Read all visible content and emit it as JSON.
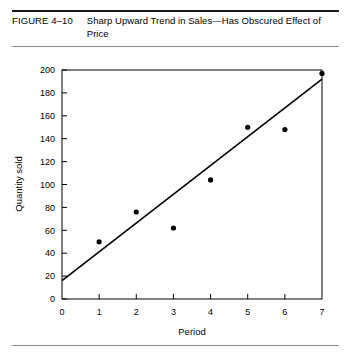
{
  "figure": {
    "label": "FIGURE 4–10",
    "title": "Sharp Upward Trend in Sales—Has Obscured Effect of Price"
  },
  "chart_data": {
    "type": "scatter",
    "title": "Sharp Upward Trend in Sales—Has Obscured Effect of Price",
    "xlabel": "Period",
    "ylabel": "Quantity sold",
    "xlim": [
      0,
      7
    ],
    "ylim": [
      0,
      200
    ],
    "grid": false,
    "legend": null,
    "x_ticks": [
      "0",
      "1",
      "2",
      "3",
      "4",
      "5",
      "6",
      "7"
    ],
    "y_ticks": [
      "0",
      "20",
      "40",
      "60",
      "80",
      "100",
      "120",
      "140",
      "160",
      "180",
      "200"
    ],
    "points": [
      {
        "x": 1,
        "y": 50
      },
      {
        "x": 2,
        "y": 76
      },
      {
        "x": 3,
        "y": 62
      },
      {
        "x": 4,
        "y": 104
      },
      {
        "x": 5,
        "y": 150
      },
      {
        "x": 6,
        "y": 148
      },
      {
        "x": 7,
        "y": 197
      }
    ],
    "series": [
      {
        "name": "Quantity sold",
        "x": [
          1,
          2,
          3,
          4,
          5,
          6,
          7
        ],
        "values": [
          50,
          76,
          62,
          104,
          150,
          148,
          197
        ]
      }
    ],
    "trend_line": {
      "name": "Trend line",
      "x_start": 0,
      "y_start": 16,
      "x_end": 7,
      "y_end": 192
    },
    "colors": {
      "point": "#000000",
      "line": "#000000",
      "axis": "#000000",
      "background": "#ffffff"
    }
  }
}
